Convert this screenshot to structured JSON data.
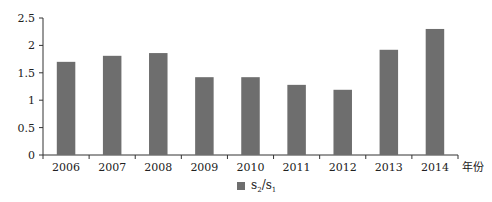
{
  "chart_data": {
    "type": "bar",
    "title": "",
    "xlabel": "年份",
    "ylabel": "",
    "categories": [
      "2006",
      "2007",
      "2008",
      "2009",
      "2010",
      "2011",
      "2012",
      "2013",
      "2014"
    ],
    "series": [
      {
        "name": "s2/s1",
        "values": [
          1.7,
          1.81,
          1.86,
          1.42,
          1.42,
          1.28,
          1.19,
          1.92,
          2.3
        ],
        "color": "#6e6e6e"
      }
    ],
    "yticks": [
      "0",
      "0.5",
      "1",
      "1.5",
      "2",
      "2.5"
    ],
    "ytick_values": [
      0,
      0.5,
      1,
      1.5,
      2,
      2.5
    ],
    "ylim": [
      0,
      2.5
    ],
    "grid": false,
    "legend_position": "bottom"
  },
  "legend": {
    "base": "s",
    "sub1": "2",
    "sep": "/s",
    "sub2": "1"
  }
}
